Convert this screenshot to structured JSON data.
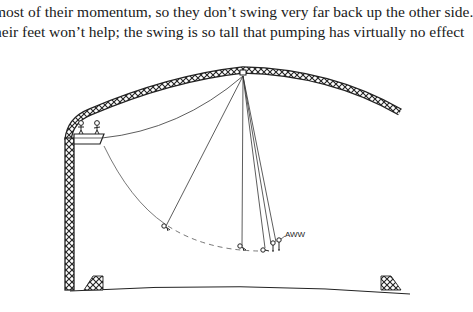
{
  "text": {
    "lines": [
      "most of their momentum, so they don’t swing very far back up the other side.",
      "heir feet won’t help; the swing is so tall that pumping has virtually no effect"
    ]
  },
  "illustration": {
    "caption_exclamation": "AWW",
    "elements": [
      "truss-arch",
      "left-tower",
      "launch-platform",
      "two-stick-figures",
      "swing-ropes",
      "swinger-positions",
      "ground-line",
      "left-net",
      "right-net"
    ]
  }
}
